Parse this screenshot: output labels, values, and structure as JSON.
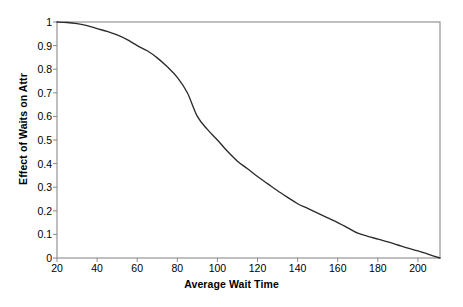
{
  "chart_data": {
    "type": "line",
    "title": "",
    "xlabel": "Average Wait Time",
    "ylabel": "Effect of Waits on Attr",
    "xlim": [
      20,
      211
    ],
    "ylim": [
      0,
      1
    ],
    "xticks": [
      20,
      40,
      60,
      80,
      100,
      120,
      140,
      160,
      180,
      200
    ],
    "yticks": [
      0,
      0.1,
      0.2,
      0.3,
      0.4,
      0.5,
      0.6,
      0.7,
      0.8,
      0.9,
      1
    ],
    "xtick_labels": [
      "20",
      "40",
      "60",
      "80",
      "100",
      "120",
      "140",
      "160",
      "180",
      "200"
    ],
    "ytick_labels": [
      "0",
      "0.1",
      "0.2",
      "0.3",
      "0.4",
      "0.5",
      "0.6",
      "0.7",
      "0.8",
      "0.9",
      "1"
    ],
    "grid": false,
    "legend": false,
    "legend_position": "none",
    "line_color": "#2b2b2b",
    "axis_color": "#8a8a8a",
    "background_color": "#ffffff",
    "series": [
      {
        "name": "Effect of Waits on Attr",
        "x": [
          20,
          25,
          30,
          35,
          40,
          45,
          50,
          55,
          60,
          65,
          70,
          75,
          80,
          85,
          90,
          95,
          100,
          105,
          110,
          115,
          120,
          125,
          130,
          135,
          140,
          145,
          150,
          155,
          160,
          165,
          170,
          175,
          180,
          185,
          190,
          195,
          200,
          205,
          211
        ],
        "y": [
          1.0,
          0.998,
          0.993,
          0.985,
          0.972,
          0.96,
          0.945,
          0.925,
          0.9,
          0.878,
          0.848,
          0.81,
          0.765,
          0.7,
          0.6,
          0.545,
          0.5,
          0.452,
          0.41,
          0.378,
          0.345,
          0.315,
          0.285,
          0.257,
          0.23,
          0.21,
          0.19,
          0.17,
          0.15,
          0.128,
          0.105,
          0.092,
          0.08,
          0.068,
          0.055,
          0.042,
          0.03,
          0.016,
          0.0
        ]
      }
    ]
  }
}
